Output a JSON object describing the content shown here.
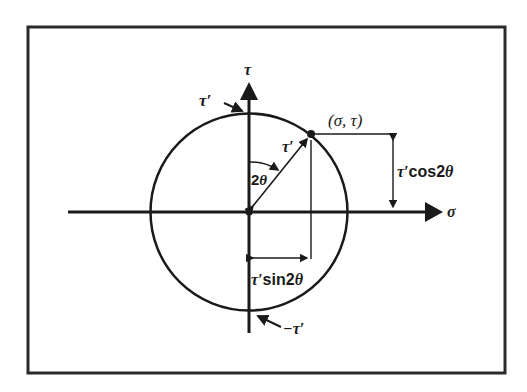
{
  "diagram": {
    "axes": {
      "horizontal_label": "σ",
      "vertical_label": "τ"
    },
    "labels": {
      "top_intercept": "τ′",
      "bottom_intercept": "−τ′",
      "radius": "τ′",
      "angle": "2θ",
      "point": "(σ, τ)",
      "vertical_projection": "τ′cos2θ",
      "horizontal_projection": "τ′sin2θ"
    },
    "colors": {
      "stroke": "#1a1a1a",
      "frame": "#2a2a2a",
      "background": "#ffffff"
    }
  }
}
